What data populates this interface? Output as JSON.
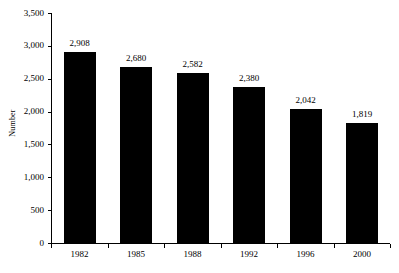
{
  "chart_data": {
    "type": "bar",
    "title": "",
    "subtitle": "",
    "xlabel": "",
    "ylabel": "Number",
    "categories": [
      "1982",
      "1985",
      "1988",
      "1992",
      "1996",
      "2000"
    ],
    "values": [
      2908,
      2680,
      2582,
      2380,
      2042,
      1819
    ],
    "value_labels": [
      "2,908",
      "2,680",
      "2,582",
      "2,380",
      "2,042",
      "1,819"
    ],
    "ylim": [
      0,
      3500
    ],
    "y_ticks": [
      0,
      500,
      1000,
      1500,
      2000,
      2500,
      3000,
      3500
    ],
    "y_tick_labels": [
      "0",
      "500",
      "1,000",
      "1,500",
      "2,000",
      "2,500",
      "3,000",
      "3,500"
    ],
    "grid": false,
    "legend": "none",
    "bar_color": "#000000",
    "background_color": "#ffffff",
    "axis_color": "#000000",
    "tick_direction": "out"
  }
}
